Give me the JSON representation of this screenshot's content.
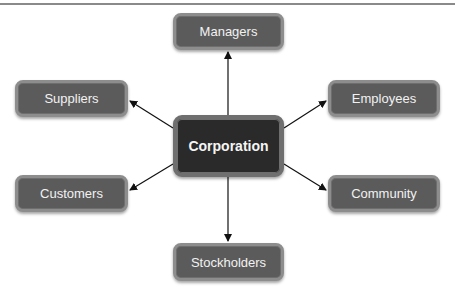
{
  "diagram": {
    "type": "hub-and-spoke",
    "center": {
      "label": "Corporation"
    },
    "nodes": [
      {
        "id": "managers",
        "label": "Managers",
        "position": "top"
      },
      {
        "id": "suppliers",
        "label": "Suppliers",
        "position": "upper-left"
      },
      {
        "id": "employees",
        "label": "Employees",
        "position": "upper-right"
      },
      {
        "id": "customers",
        "label": "Customers",
        "position": "lower-left"
      },
      {
        "id": "community",
        "label": "Community",
        "position": "lower-right"
      },
      {
        "id": "stockholders",
        "label": "Stockholders",
        "position": "bottom"
      }
    ],
    "edges": [
      {
        "from": "Corporation",
        "to": "Managers"
      },
      {
        "from": "Corporation",
        "to": "Suppliers"
      },
      {
        "from": "Corporation",
        "to": "Employees"
      },
      {
        "from": "Corporation",
        "to": "Customers"
      },
      {
        "from": "Corporation",
        "to": "Community"
      },
      {
        "from": "Corporation",
        "to": "Stockholders"
      }
    ]
  },
  "colors": {
    "node_fill": "#5b5b5b",
    "center_fill": "#2a2a2a",
    "node_border": "#8d8d8d",
    "arrow": "#111111"
  }
}
